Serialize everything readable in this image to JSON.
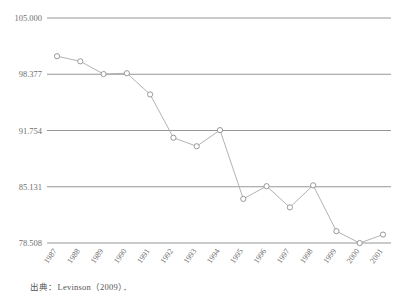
{
  "chart_data": {
    "type": "line",
    "title": "",
    "xlabel": "",
    "ylabel": "",
    "categories": [
      "1987",
      "1988",
      "1989",
      "1990",
      "1991",
      "1992",
      "1993",
      "1994",
      "1995",
      "1996",
      "1997",
      "1998",
      "1999",
      "2000",
      "2001"
    ],
    "values": [
      100.5,
      99.9,
      98.4,
      98.5,
      96.0,
      90.9,
      89.9,
      91.8,
      83.7,
      85.2,
      82.7,
      85.3,
      79.9,
      78.5,
      79.5
    ],
    "ytick_labels": [
      "105.000",
      "98.377",
      "91.754",
      "85.131",
      "78.508"
    ],
    "ytick_values": [
      105.0,
      98.377,
      91.754,
      85.131,
      78.508
    ],
    "ylim": [
      78.508,
      105.0
    ],
    "grid": true,
    "legend": "none",
    "marker": "open-circle",
    "line_color": "#a9a9a9",
    "grid_color": "#8a8a8a",
    "text_color": "#6f6f6f"
  },
  "footer": {
    "source_note": "出典：Levinson（2009）．"
  }
}
